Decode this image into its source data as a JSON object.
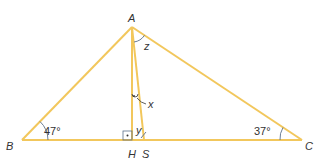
{
  "diagram": {
    "type": "triangle",
    "line_color": "#f2c75c",
    "arc_color": "#5a6f8a",
    "vertices": {
      "A": {
        "label": "A",
        "x": 132,
        "y": 27
      },
      "B": {
        "label": "B",
        "x": 22,
        "y": 140
      },
      "C": {
        "label": "C",
        "x": 302,
        "y": 140
      },
      "H": {
        "label": "H",
        "x": 132,
        "y": 140
      },
      "S": {
        "label": "S",
        "x": 144,
        "y": 140
      }
    },
    "angles": {
      "B": "47°",
      "C": "37°",
      "x": "x",
      "y": "y",
      "z": "z"
    },
    "segments": [
      "AB",
      "AC",
      "BC",
      "AH",
      "AS"
    ]
  }
}
